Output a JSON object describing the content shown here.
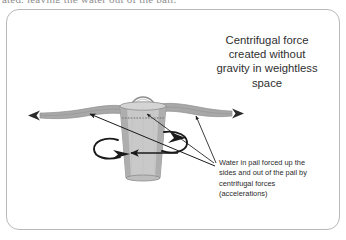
{
  "page": {
    "clipped_top_line": "ated, leaving the water out of the pail.",
    "background_color": "#ffffff"
  },
  "frame": {
    "border_color": "#b9b9b9",
    "corner_radius": 13
  },
  "heading": {
    "lines": [
      "Centrifugal force",
      "created without",
      "gravity in weightless",
      "space"
    ],
    "full_text": "Centrifugal force created without gravity in weightless space",
    "color": "#2f2f2f",
    "align": "center"
  },
  "caption": {
    "lines": [
      "Water in pail forced up the",
      "sides and out of the pail by",
      "centrifugal forces",
      "(accelerations)"
    ],
    "full_text": "Water in pail forced up the sides and out of the pail by centrifugal forces (accelerations)",
    "color": "#2a2a2a",
    "align": "left"
  },
  "diagram": {
    "colors": {
      "pail_body": "#c9c9c9",
      "pail_side_shade": "#9d9d9d",
      "pail_outline": "#8a8a8a",
      "water_stream": "#a8a8a8",
      "water_stream_shade": "#8f8f8f",
      "arrow": "#1a1a1a",
      "handle": "#8a8a8a",
      "water_level_dash": "#7a7a7a"
    },
    "elements": [
      {
        "name": "pail",
        "label": "pail"
      },
      {
        "name": "pail-handle",
        "label": "handle"
      },
      {
        "name": "water-level-line",
        "label": "water surface (dashed)"
      },
      {
        "name": "water-stream-left",
        "label": "water flung out left"
      },
      {
        "name": "water-stream-right",
        "label": "water flung out right"
      },
      {
        "name": "rotation-arrow-left",
        "label": "rotation direction left"
      },
      {
        "name": "rotation-arrow-right",
        "label": "rotation direction right"
      },
      {
        "name": "force-arrow-diagonal",
        "label": "centrifugal force arrow"
      },
      {
        "name": "caption-pointer-left",
        "label": "pointer to left stream"
      },
      {
        "name": "caption-pointer-right",
        "label": "pointer to right stream"
      }
    ]
  }
}
